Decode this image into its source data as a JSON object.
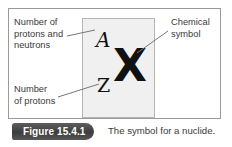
{
  "figure": {
    "outer_frame_name": "diagram-border",
    "panel": {
      "superscript_label": "A",
      "subscript_label": "Z",
      "element_symbol": "X"
    },
    "annotations": [
      {
        "id": "mass-number",
        "text": "Number of\nprotons and\nneutrons"
      },
      {
        "id": "atomic-number",
        "text": "Number\nof protons"
      },
      {
        "id": "chemical-symbol",
        "text": "Chemical\nsymbol"
      }
    ],
    "caption": {
      "badge": "Figure 15.4.1",
      "text": "The symbol for a nuclide."
    },
    "colors": {
      "panel_fill": "#f0f0f0",
      "panel_border": "#b5b5b5",
      "outer_border": "#9a9a9a",
      "badge_fill": "#4a4a4a",
      "badge_text": "#ffffff",
      "body_text": "#3a3a3a",
      "symbol_text": "#111111",
      "leader_line": "#777777"
    }
  }
}
